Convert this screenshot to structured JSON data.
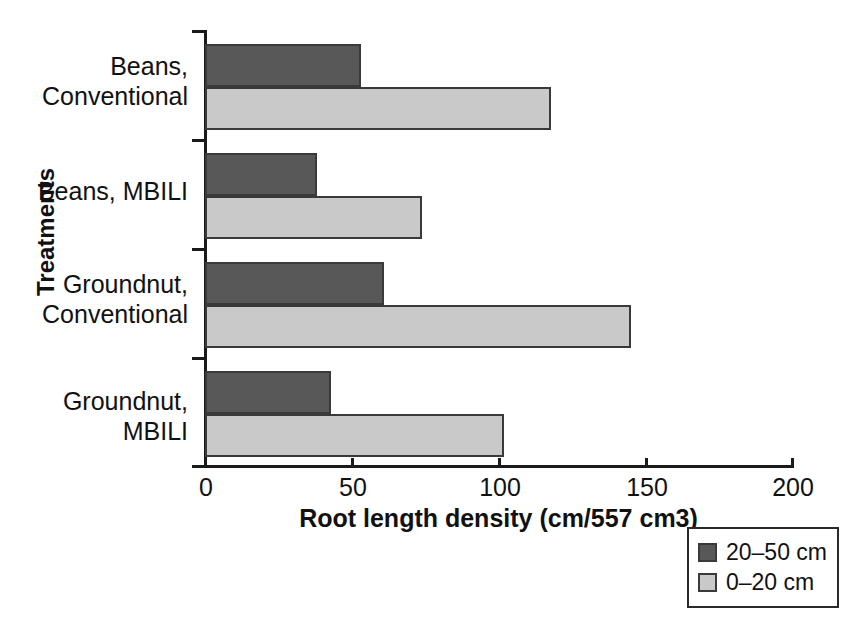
{
  "chart_data": {
    "type": "bar",
    "orientation": "horizontal",
    "title": "",
    "xlabel": "Root length density (cm/557 cm3)",
    "ylabel": "Treatments",
    "xlim": [
      0,
      200
    ],
    "xticks": [
      0,
      50,
      100,
      150,
      200
    ],
    "xticklabels": [
      "0",
      "50",
      "100",
      "150",
      "200"
    ],
    "grid": false,
    "legend_position": "bottom-right",
    "categories": [
      "Beans, Conventional",
      "Beans, MBILI",
      "Groundnut, Conventional",
      "Groundnut, MBILI"
    ],
    "category_lines": [
      [
        "Beans,",
        "Conventional"
      ],
      [
        "Beans, MBILI"
      ],
      [
        "Groundnut,",
        "Conventional"
      ],
      [
        "Groundnut,",
        "MBILI"
      ]
    ],
    "series": [
      {
        "name": "20–50 cm",
        "color": "#585858",
        "values": [
          53,
          38,
          61,
          43
        ]
      },
      {
        "name": "0–20 cm",
        "color": "#c9c9c9",
        "values": [
          118,
          74,
          145,
          102
        ]
      }
    ]
  },
  "legend": {
    "items": [
      {
        "label": "20–50 cm",
        "swatch": "dark"
      },
      {
        "label": "0–20 cm",
        "swatch": "light"
      }
    ]
  }
}
